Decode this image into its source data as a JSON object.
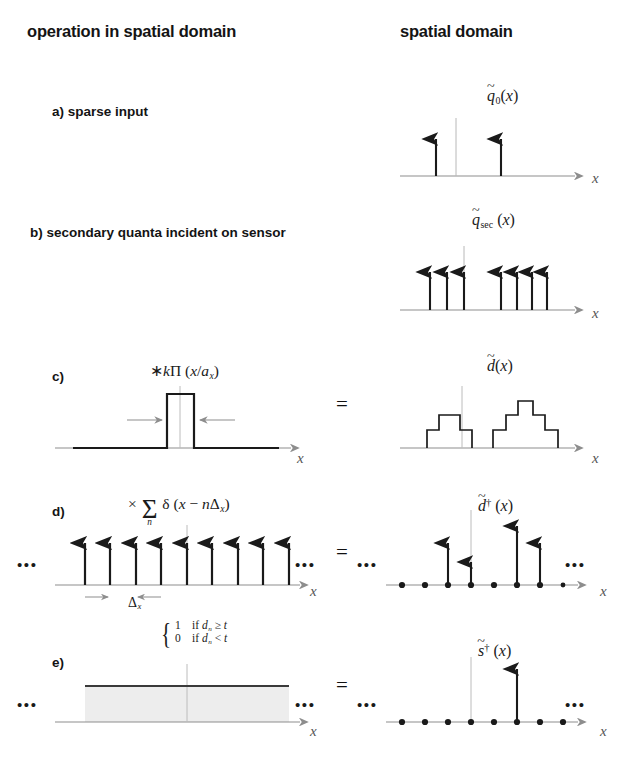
{
  "figure": {
    "headers": {
      "left": "operation in spatial domain",
      "right": "spatial domain"
    },
    "equals_sign": "=",
    "ellipsis": "•••",
    "axis_label": "x",
    "colors": {
      "ink": "#1a1a1a",
      "axis": "#8d8d8d",
      "guide": "#b0b0b0",
      "shade": "#ededed",
      "background": "#ffffff"
    }
  },
  "rows": [
    {
      "id": "a",
      "label": "a) sparse input",
      "operation": null,
      "result_function": "q̅0(x)",
      "right_panel": {
        "type": "impulses",
        "impulse_positions": [
          0.22,
          0.55
        ],
        "impulse_heights": [
          1.0,
          1.0
        ],
        "show_dots": false,
        "show_samples": false
      }
    },
    {
      "id": "b",
      "label": "b) secondary quanta incident on sensor",
      "operation": null,
      "result_function": "q̅sec(x)",
      "right_panel": {
        "type": "impulses",
        "impulse_positions": [
          0.17,
          0.25,
          0.33,
          0.53,
          0.61,
          0.68,
          0.75
        ],
        "impulse_heights": [
          1.0,
          1.0,
          1.0,
          1.0,
          1.0,
          1.0,
          1.0
        ],
        "show_dots": false,
        "show_samples": false
      }
    },
    {
      "id": "c",
      "label": "c)",
      "operation": "*kΠ(x/a_x)",
      "result_function": "d̃(x)",
      "left_panel": {
        "type": "rect",
        "center": 0.5,
        "half_width": 0.055,
        "height": 1.0,
        "width_arrows": true
      },
      "right_panel": {
        "type": "staircase",
        "groups": [
          {
            "start": 0.14,
            "step_width": 0.055,
            "levels": [
              0.33,
              0.63,
              0.63,
              0.33
            ]
          },
          {
            "start": 0.5,
            "step_width": 0.055,
            "levels": [
              0.33,
              0.63,
              1.0,
              0.63,
              0.33
            ]
          }
        ]
      }
    },
    {
      "id": "d",
      "label": "d)",
      "operation": "× Σ_n δ(x − nΔ_x)",
      "spacing_label": "Δ_x",
      "result_function": "d̃†(x)",
      "left_panel": {
        "type": "comb",
        "count": 9,
        "first": 0.11,
        "spacing": 0.095,
        "height": 1.0,
        "show_dots": true,
        "spacing_arrows": true
      },
      "right_panel": {
        "type": "sampled",
        "count": 9,
        "first": 0.11,
        "spacing": 0.095,
        "impulse_indices": [
          3,
          4,
          6,
          7
        ],
        "impulse_heights": [
          0.62,
          0.27,
          1.0,
          0.62
        ],
        "show_dots": true
      }
    },
    {
      "id": "e",
      "label": "e)",
      "operation_cases": [
        {
          "value": "1",
          "condition": "if d_n ≥ t"
        },
        {
          "value": "0",
          "condition": "if d_n < t"
        }
      ],
      "result_function": "s̃†(x)",
      "left_panel": {
        "type": "threshold",
        "threshold_level": 0.72,
        "shaded": true,
        "show_dots": true
      },
      "right_panel": {
        "type": "sampled",
        "count": 9,
        "first": 0.11,
        "spacing": 0.095,
        "impulse_indices": [
          6
        ],
        "impulse_heights": [
          1.0
        ],
        "show_dots": true
      }
    }
  ]
}
